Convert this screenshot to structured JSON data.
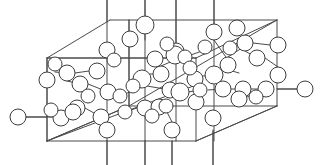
{
  "figure": {
    "background_color": "#ffffff",
    "line_color": "#4a4a4a",
    "atom_fill_color": "#ffffff",
    "atom_stroke_color": "#3d3d3d",
    "atom_radius": 8,
    "atom_count": 56,
    "width": 323,
    "height": 165
  },
  "chart_data": {
    "type": "scatter",
    "xlabel": "",
    "ylabel": "",
    "xlim": [
      0,
      323
    ],
    "ylim": [
      0,
      165
    ],
    "grid": false,
    "legend": null,
    "cell_outline": {
      "name": "unit-cell-parallelepiped",
      "vertices": {
        "front_bottom_left": [
          47,
          141
        ],
        "front_bottom_right": [
          196,
          141
        ],
        "front_top_right": [
          196,
          85
        ],
        "front_top_left": [
          47,
          58
        ],
        "back_bottom_left": [
          129,
          106
        ],
        "back_bottom_right": [
          277,
          106
        ],
        "back_top_right": [
          277,
          20
        ],
        "back_top_left": [
          110,
          20
        ]
      },
      "edges": [
        [
          [
            47,
            58
          ],
          [
            110,
            20
          ]
        ],
        [
          [
            110,
            20
          ],
          [
            277,
            20
          ]
        ],
        [
          [
            277,
            20
          ],
          [
            277,
            106
          ]
        ],
        [
          [
            277,
            106
          ],
          [
            196,
            141
          ]
        ],
        [
          [
            196,
            141
          ],
          [
            47,
            141
          ]
        ],
        [
          [
            47,
            141
          ],
          [
            47,
            58
          ]
        ],
        [
          [
            47,
            58
          ],
          [
            196,
            58
          ]
        ],
        [
          [
            196,
            58
          ],
          [
            277,
            20
          ]
        ],
        [
          [
            196,
            58
          ],
          [
            196,
            141
          ]
        ],
        [
          [
            47,
            141
          ],
          [
            129,
            106
          ]
        ],
        [
          [
            129,
            106
          ],
          [
            277,
            106
          ]
        ],
        [
          [
            129,
            106
          ],
          [
            129,
            20
          ]
        ]
      ]
    },
    "bond_stubs_top": [
      {
        "x": 107,
        "y_from": 0,
        "y_to": 22
      },
      {
        "x": 145,
        "y_from": 0,
        "y_to": 40
      },
      {
        "x": 176,
        "y_from": 0,
        "y_to": 44
      },
      {
        "x": 214,
        "y_from": 0,
        "y_to": 28
      }
    ],
    "bond_stubs_bottom": [
      {
        "x": 107,
        "y_from": 141,
        "y_to": 165
      },
      {
        "x": 145,
        "y_from": 141,
        "y_to": 165
      },
      {
        "x": 172,
        "y_from": 141,
        "y_to": 165
      },
      {
        "x": 213,
        "y_from": 130,
        "y_to": 165
      }
    ],
    "bond_stubs_side": [
      {
        "x_from": 26,
        "x_to": 47,
        "y": 117
      },
      {
        "x_from": 277,
        "x_to": 297,
        "y": 89
      }
    ],
    "atoms": [
      {
        "id": 1,
        "x": 18,
        "y": 117,
        "r": 8
      },
      {
        "id": 2,
        "x": 305,
        "y": 89,
        "r": 8
      },
      {
        "id": 3,
        "x": 145,
        "y": 25,
        "r": 9
      },
      {
        "id": 4,
        "x": 214,
        "y": 32,
        "r": 8
      },
      {
        "id": 5,
        "x": 107,
        "y": 50,
        "r": 8
      },
      {
        "id": 6,
        "x": 130,
        "y": 39,
        "r": 8
      },
      {
        "id": 7,
        "x": 176,
        "y": 51,
        "r": 8
      },
      {
        "id": 8,
        "x": 245,
        "y": 43,
        "r": 8
      },
      {
        "id": 9,
        "x": 278,
        "y": 45,
        "r": 8
      },
      {
        "id": 10,
        "x": 257,
        "y": 58,
        "r": 8
      },
      {
        "id": 11,
        "x": 155,
        "y": 59,
        "r": 8
      },
      {
        "id": 12,
        "x": 175,
        "y": 55,
        "r": 9
      },
      {
        "id": 13,
        "x": 185,
        "y": 57,
        "r": 7
      },
      {
        "id": 14,
        "x": 228,
        "y": 65,
        "r": 8
      },
      {
        "id": 15,
        "x": 67,
        "y": 73,
        "r": 8
      },
      {
        "id": 16,
        "x": 97,
        "y": 71,
        "r": 8
      },
      {
        "id": 17,
        "x": 47,
        "y": 80,
        "r": 8
      },
      {
        "id": 18,
        "x": 80,
        "y": 84,
        "r": 8
      },
      {
        "id": 19,
        "x": 142,
        "y": 79,
        "r": 9
      },
      {
        "id": 20,
        "x": 161,
        "y": 74,
        "r": 8
      },
      {
        "id": 21,
        "x": 195,
        "y": 79,
        "r": 8
      },
      {
        "id": 22,
        "x": 214,
        "y": 75,
        "r": 9
      },
      {
        "id": 23,
        "x": 278,
        "y": 75,
        "r": 8
      },
      {
        "id": 24,
        "x": 108,
        "y": 92,
        "r": 8
      },
      {
        "id": 25,
        "x": 120,
        "y": 96,
        "r": 7
      },
      {
        "id": 26,
        "x": 170,
        "y": 90,
        "r": 8
      },
      {
        "id": 27,
        "x": 180,
        "y": 92,
        "r": 9
      },
      {
        "id": 28,
        "x": 223,
        "y": 89,
        "r": 8
      },
      {
        "id": 29,
        "x": 243,
        "y": 89,
        "r": 8
      },
      {
        "id": 30,
        "x": 266,
        "y": 89,
        "r": 8
      },
      {
        "id": 31,
        "x": 77,
        "y": 108,
        "r": 8
      },
      {
        "id": 32,
        "x": 196,
        "y": 102,
        "r": 8
      },
      {
        "id": 33,
        "x": 239,
        "y": 99,
        "r": 8
      },
      {
        "id": 34,
        "x": 61,
        "y": 118,
        "r": 8
      },
      {
        "id": 35,
        "x": 73,
        "y": 112,
        "r": 8
      },
      {
        "id": 36,
        "x": 145,
        "y": 108,
        "r": 8
      },
      {
        "id": 37,
        "x": 159,
        "y": 107,
        "r": 8
      },
      {
        "id": 38,
        "x": 166,
        "y": 106,
        "r": 7
      },
      {
        "id": 39,
        "x": 101,
        "y": 117,
        "r": 8
      },
      {
        "id": 40,
        "x": 213,
        "y": 118,
        "r": 8
      },
      {
        "id": 41,
        "x": 107,
        "y": 130,
        "r": 8
      },
      {
        "id": 42,
        "x": 172,
        "y": 130,
        "r": 8
      },
      {
        "id": 43,
        "x": 237,
        "y": 28,
        "r": 8
      },
      {
        "id": 44,
        "x": 205,
        "y": 47,
        "r": 7
      },
      {
        "id": 45,
        "x": 55,
        "y": 64,
        "r": 7
      },
      {
        "id": 46,
        "x": 114,
        "y": 60,
        "r": 7
      },
      {
        "id": 47,
        "x": 190,
        "y": 68,
        "r": 7
      },
      {
        "id": 48,
        "x": 133,
        "y": 86,
        "r": 7
      },
      {
        "id": 49,
        "x": 88,
        "y": 96,
        "r": 7
      },
      {
        "id": 50,
        "x": 256,
        "y": 97,
        "r": 7
      },
      {
        "id": 51,
        "x": 51,
        "y": 110,
        "r": 7
      },
      {
        "id": 52,
        "x": 152,
        "y": 116,
        "r": 7
      },
      {
        "id": 53,
        "x": 200,
        "y": 90,
        "r": 7
      },
      {
        "id": 54,
        "x": 125,
        "y": 112,
        "r": 7
      },
      {
        "id": 55,
        "x": 230,
        "y": 48,
        "r": 7
      },
      {
        "id": 56,
        "x": 167,
        "y": 44,
        "r": 7
      }
    ],
    "bonds": [
      [
        [
          26,
          117
        ],
        [
          53,
          117
        ]
      ],
      [
        [
          277,
          89
        ],
        [
          297,
          89
        ]
      ],
      [
        [
          145,
          0
        ],
        [
          145,
          22
        ]
      ],
      [
        [
          107,
          0
        ],
        [
          107,
          42
        ]
      ],
      [
        [
          176,
          0
        ],
        [
          176,
          43
        ]
      ],
      [
        [
          214,
          0
        ],
        [
          214,
          24
        ]
      ],
      [
        [
          107,
          58
        ],
        [
          107,
          141
        ]
      ],
      [
        [
          145,
          33
        ],
        [
          145,
          141
        ]
      ],
      [
        [
          176,
          59
        ],
        [
          176,
          141
        ]
      ],
      [
        [
          214,
          40
        ],
        [
          214,
          141
        ]
      ],
      [
        [
          107,
          141
        ],
        [
          107,
          165
        ]
      ],
      [
        [
          145,
          141
        ],
        [
          145,
          165
        ]
      ],
      [
        [
          172,
          141
        ],
        [
          172,
          165
        ]
      ],
      [
        [
          213,
          131
        ],
        [
          213,
          165
        ]
      ],
      [
        [
          55,
          72
        ],
        [
          67,
          73
        ]
      ],
      [
        [
          75,
          73
        ],
        [
          89,
          71
        ]
      ],
      [
        [
          67,
          81
        ],
        [
          80,
          84
        ]
      ],
      [
        [
          88,
          84
        ],
        [
          108,
          92
        ]
      ],
      [
        [
          120,
          96
        ],
        [
          142,
          87
        ]
      ],
      [
        [
          150,
          74
        ],
        [
          161,
          74
        ]
      ],
      [
        [
          161,
          66
        ],
        [
          175,
          60
        ]
      ],
      [
        [
          185,
          57
        ],
        [
          205,
          50
        ]
      ],
      [
        [
          214,
          40
        ],
        [
          228,
          60
        ]
      ],
      [
        [
          228,
          57
        ],
        [
          245,
          46
        ]
      ],
      [
        [
          253,
          43
        ],
        [
          270,
          45
        ]
      ],
      [
        [
          245,
          51
        ],
        [
          257,
          58
        ]
      ],
      [
        [
          265,
          58
        ],
        [
          278,
          67
        ]
      ],
      [
        [
          222,
          68
        ],
        [
          239,
          73
        ]
      ],
      [
        [
          203,
          76
        ],
        [
          214,
          75
        ]
      ],
      [
        [
          187,
          79
        ],
        [
          195,
          79
        ]
      ],
      [
        [
          147,
          86
        ],
        [
          170,
          90
        ]
      ],
      [
        [
          188,
          92
        ],
        [
          200,
          90
        ]
      ],
      [
        [
          208,
          90
        ],
        [
          223,
          89
        ]
      ],
      [
        [
          231,
          89
        ],
        [
          243,
          89
        ]
      ],
      [
        [
          251,
          89
        ],
        [
          266,
          89
        ]
      ],
      [
        [
          235,
          95
        ],
        [
          256,
          97
        ]
      ],
      [
        [
          85,
          108
        ],
        [
          101,
          117
        ]
      ],
      [
        [
          69,
          112
        ],
        [
          77,
          108
        ]
      ],
      [
        [
          61,
          118
        ],
        [
          73,
          112
        ]
      ],
      [
        [
          137,
          108
        ],
        [
          125,
          112
        ]
      ],
      [
        [
          152,
          108
        ],
        [
          159,
          107
        ]
      ],
      [
        [
          166,
          110
        ],
        [
          172,
          122
        ]
      ],
      [
        [
          196,
          94
        ],
        [
          196,
          102
        ]
      ],
      [
        [
          47,
          58
        ],
        [
          47,
          141
        ]
      ],
      [
        [
          129,
          20
        ],
        [
          129,
          106
        ]
      ]
    ],
    "interior_diagonals": [
      [
        [
          47,
          141
        ],
        [
          196,
          85
        ]
      ],
      [
        [
          129,
          106
        ],
        [
          277,
          20
        ]
      ],
      [
        [
          47,
          58
        ],
        [
          196,
          58
        ]
      ],
      [
        [
          47,
          141
        ],
        [
          129,
          106
        ]
      ],
      [
        [
          196,
          141
        ],
        [
          277,
          106
        ]
      ]
    ]
  }
}
